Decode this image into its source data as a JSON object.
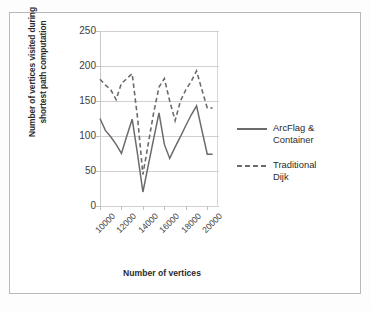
{
  "chart_data": {
    "type": "line",
    "title": "",
    "xlabel": "Number of vertices",
    "ylabel": "Number of vertices visited during shortest path computation",
    "ylabel_line1": "Number of vertices visited during",
    "ylabel_line2": "shortest path computation",
    "ylim": [
      0,
      250
    ],
    "yticks": [
      0,
      50,
      100,
      150,
      200,
      250
    ],
    "xticks": [
      "10000",
      "12000",
      "14000",
      "16000",
      "18000",
      "20000"
    ],
    "xlim": [
      10000,
      21000
    ],
    "grid": "horizontal",
    "legend_position": "right",
    "x": [
      10000,
      10500,
      11000,
      11500,
      12000,
      12500,
      13000,
      13500,
      14000,
      14500,
      15000,
      15500,
      16000,
      16500,
      17000,
      17500,
      18000,
      18500,
      19000,
      19500,
      20000,
      20500
    ],
    "series": [
      {
        "name": "ArcFlag & Container",
        "style": "solid",
        "color": "#6b6b6b",
        "values": [
          125,
          108,
          99,
          88,
          75,
          100,
          124,
          74,
          20,
          58,
          96,
          133,
          88,
          68,
          84,
          99,
          115,
          130,
          143,
          108,
          74,
          74
        ]
      },
      {
        "name": "Traditional Dijk",
        "style": "dashed",
        "color": "#6b6b6b",
        "values": [
          181,
          173,
          166,
          152,
          175,
          182,
          189,
          126,
          45,
          89,
          133,
          170,
          182,
          150,
          122,
          150,
          166,
          178,
          193,
          166,
          140,
          140
        ]
      }
    ]
  },
  "legend": {
    "entries": [
      {
        "label_line1": "ArcFlag &",
        "label_line2": "Container",
        "style": "solid"
      },
      {
        "label_line1": "Traditional",
        "label_line2": "Dijk",
        "style": "dashed"
      }
    ]
  },
  "axes": {
    "y_tick_0": "0",
    "y_tick_1": "50",
    "y_tick_2": "100",
    "y_tick_3": "150",
    "y_tick_4": "200",
    "y_tick_5": "250",
    "x_tick_0": "10000",
    "x_tick_1": "12000",
    "x_tick_2": "14000",
    "x_tick_3": "16000",
    "x_tick_4": "18000",
    "x_tick_5": "20000"
  }
}
